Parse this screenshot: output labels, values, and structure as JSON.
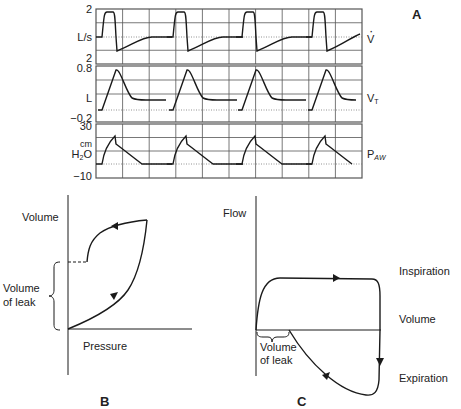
{
  "panel_a": {
    "label": "A",
    "grid": {
      "left": 96,
      "right": 362,
      "columns": 10
    },
    "strips": [
      {
        "name": "flow",
        "top": 9,
        "bottom": 64,
        "baseline": 37,
        "axis_top": "2",
        "unit": "L/s",
        "axis_bottom": "2",
        "signal": "V",
        "signal_mark": "dot"
      },
      {
        "name": "tidal-volume",
        "top": 66,
        "bottom": 122,
        "baseline": 110,
        "axis_top": "0.8",
        "unit": "L",
        "axis_bottom": "−0.2",
        "signal": "V",
        "signal_sub": "T"
      },
      {
        "name": "airway-pressure",
        "top": 124,
        "bottom": 178,
        "baseline": 164,
        "axis_top": "30",
        "unit_line1": "cm",
        "unit_line2": "H",
        "unit_sub": "2",
        "unit_line2b": "O",
        "axis_bottom": "−10",
        "signal": "P",
        "signal_sub": "AW"
      }
    ],
    "breath_starts": [
      102,
      173,
      242,
      312
    ]
  },
  "panel_b": {
    "label": "B",
    "y_axis_label": "Volume",
    "x_axis_label": "Pressure",
    "leak_label_line1": "Volume",
    "leak_label_line2": "of leak"
  },
  "panel_c": {
    "label": "C",
    "y_axis_label": "Flow",
    "x_axis_label": "Volume",
    "upper_label": "Inspiration",
    "lower_label": "Expiration",
    "leak_label_line1": "Volume",
    "leak_label_line2": "of leak"
  },
  "colors": {
    "line": "#1a1a1a",
    "grid": "#555555",
    "dotted": "#777777"
  }
}
